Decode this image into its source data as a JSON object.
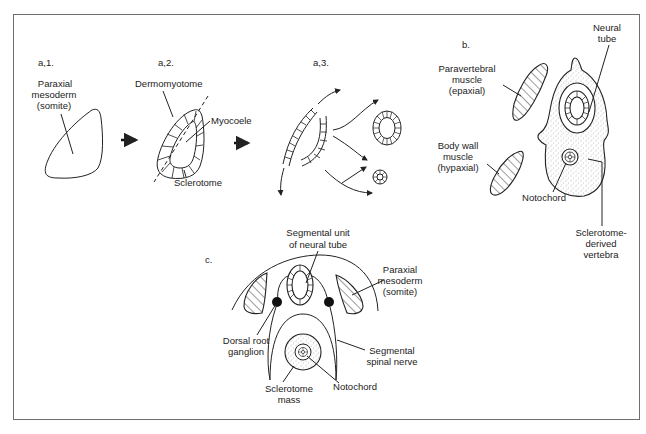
{
  "figure": {
    "panels": {
      "a1": {
        "label": "a,1.",
        "callouts": {
          "paraxial_line1": "Paraxial",
          "paraxial_line2": "mesoderm",
          "paraxial_line3": "(somite)"
        }
      },
      "a2": {
        "label": "a,2.",
        "callouts": {
          "dermomyotome": "Dermomyotome",
          "myocoele": "Myocoele",
          "sclerotome": "Sclerotome"
        }
      },
      "a3": {
        "label": "a,3."
      },
      "b": {
        "label": "b.",
        "callouts": {
          "neural_tube_line1": "Neural",
          "neural_tube_line2": "tube",
          "paravertebral_line1": "Paravertebral",
          "paravertebral_line2": "muscle",
          "paravertebral_line3": "(epaxial)",
          "bodywall_line1": "Body wall",
          "bodywall_line2": "muscle",
          "bodywall_line3": "(hypaxial)",
          "notochord": "Notochord",
          "sclerotome_line1": "Sclerotome-",
          "sclerotome_line2": "derived",
          "sclerotome_line3": "vertebra"
        }
      },
      "c": {
        "label": "c.",
        "callouts": {
          "segmental_unit_line1": "Segmental unit",
          "segmental_unit_line2": "of neural tube",
          "paraxial_line1": "Paraxial",
          "paraxial_line2": "mesoderm",
          "paraxial_line3": "(somite)",
          "drg_line1": "Dorsal root",
          "drg_line2": "ganglion",
          "spinal_nerve_line1": "Segmental",
          "spinal_nerve_line2": "spinal nerve",
          "sclerotome_mass_line1": "Sclerotome",
          "sclerotome_mass_line2": "mass",
          "notochord": "Notochord"
        }
      }
    },
    "colors": {
      "line": "#222222",
      "frame": "#6e6e6e",
      "stipple": "#9a9a9a",
      "background": "#ffffff"
    }
  }
}
